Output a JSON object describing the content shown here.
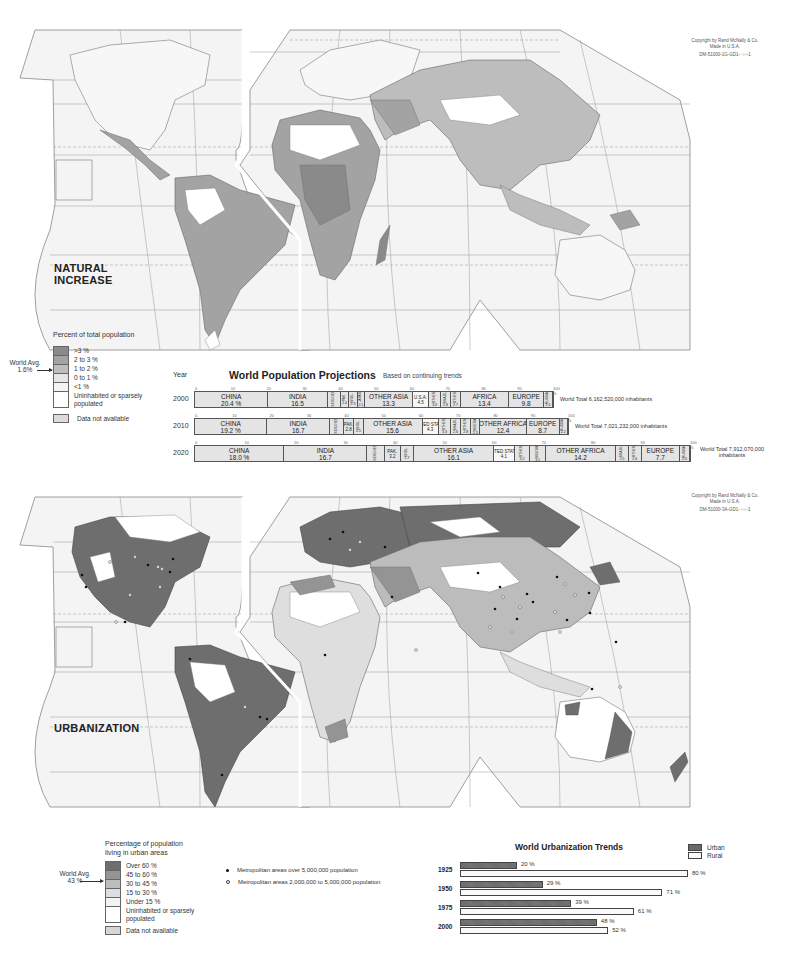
{
  "natural_increase_map": {
    "title_line1": "NATURAL",
    "title_line2": "INCREASE",
    "copyright_line1": "Copyright by Rand McNally & Co.",
    "copyright_line2": "Made in U.S.A.",
    "copyright_line3": "DM-51000-1G-GD1- -:-:-1",
    "grid_labels": {
      "arctic_circle": "Arctic Circle",
      "tropic_cancer": "Tropic of Cancer",
      "tropic_capricorn_1": "Tropic of",
      "tropic_capricorn_2": "Capricorn",
      "equator_west": "Equator",
      "equator_east": "Equator",
      "lon_100w": "100 W",
      "lon_140": "140",
      "lon_160": "160",
      "lat_0": "0",
      "lat_20": "20",
      "lat_40": "40",
      "lat_60": "60"
    },
    "legend": {
      "title": "Percent of total population",
      "world_avg_line1": "World Avg.",
      "world_avg_line2": "1.6%",
      "items": [
        {
          "label": ">3 %",
          "color": "#8a8a8a"
        },
        {
          "label": "2 to 3 %",
          "color": "#a3a3a3"
        },
        {
          "label": "1 to 2 %",
          "color": "#bdbdbd"
        },
        {
          "label": "0 to 1 %",
          "color": "#e6e6e6"
        },
        {
          "label": "<1 %",
          "color": "#f4f4f4"
        },
        {
          "label": "Uninhabited or sparsely populated",
          "color": "#ffffff"
        }
      ],
      "na_label": "Data not available",
      "na_color": "#dcdcdc"
    }
  },
  "population_projections": {
    "year_header": "Year",
    "title": "World Population Projections",
    "subtitle": "Based on continuing trends",
    "rows": [
      {
        "year": "2000",
        "total": "World Total 6,162,520,000 inhabitants",
        "segments": [
          {
            "name": "CHINA",
            "value": "20.4 %",
            "pct": 20.4,
            "size": "large"
          },
          {
            "name": "INDIA",
            "value": "16.5",
            "pct": 16.5,
            "size": "large"
          },
          {
            "name": "INDO-NESIA",
            "value": "3.6",
            "pct": 3.6,
            "size": "small"
          },
          {
            "name": "PAK.",
            "value": "2.4",
            "pct": 2.4,
            "size": "small"
          },
          {
            "name": "BNGL.",
            "value": "2.3",
            "pct": 2.3,
            "size": "small"
          },
          {
            "name": "JAPAN",
            "value": "2.1",
            "pct": 2.1,
            "size": "small"
          },
          {
            "name": "OTHER ASIA",
            "value": "13.3",
            "pct": 13.3,
            "size": "large"
          },
          {
            "name": "U.S.A.",
            "value": "4.5",
            "pct": 4.5,
            "size": "mid",
            "white": true
          },
          {
            "name": "OTHER",
            "value": "3.3",
            "pct": 3.3,
            "size": "small"
          },
          {
            "name": "BRAZIL",
            "value": "2.8",
            "pct": 2.8,
            "size": "small"
          },
          {
            "name": "OTHER",
            "value": "2.7",
            "pct": 2.7,
            "size": "small"
          },
          {
            "name": "AFRICA",
            "value": "13.4",
            "pct": 13.4,
            "size": "large"
          },
          {
            "name": "EUROPE",
            "value": "9.8",
            "pct": 9.8,
            "size": "large"
          },
          {
            "name": "RUSSIA",
            "value": "2.4",
            "pct": 2.4,
            "size": "small"
          }
        ]
      },
      {
        "year": "2010",
        "total": "World Total 7,021,232,000 inhabitants",
        "segments": [
          {
            "name": "CHINA",
            "value": "19.2 %",
            "pct": 19.2,
            "size": "large"
          },
          {
            "name": "INDIA",
            "value": "16.7",
            "pct": 16.7,
            "size": "large"
          },
          {
            "name": "INDO-NESIA",
            "value": "3.6",
            "pct": 3.6,
            "size": "small"
          },
          {
            "name": "PAK.",
            "value": "2.8",
            "pct": 2.8,
            "size": "mid"
          },
          {
            "name": "BNGL.",
            "value": "2.5",
            "pct": 2.5,
            "size": "small"
          },
          {
            "name": "OTHER ASIA",
            "value": "15.6",
            "pct": 15.6,
            "size": "large"
          },
          {
            "name": "UNITED STATES",
            "value": "4.3",
            "pct": 4.3,
            "size": "mid",
            "white": true
          },
          {
            "name": "OTHER",
            "value": "3.3",
            "pct": 3.3,
            "size": "small"
          },
          {
            "name": "BRAZIL",
            "value": "2.6",
            "pct": 2.6,
            "size": "small"
          },
          {
            "name": "OTHER",
            "value": "2.8",
            "pct": 2.8,
            "size": "small"
          },
          {
            "name": "NIGERIA",
            "value": "2.3",
            "pct": 2.3,
            "size": "small"
          },
          {
            "name": "OTHER AFRICA",
            "value": "12.4",
            "pct": 12.4,
            "size": "large"
          },
          {
            "name": "EUROPE",
            "value": "8.7",
            "pct": 8.7,
            "size": "large"
          },
          {
            "name": "RUSSIA",
            "value": "2.2",
            "pct": 2.2,
            "size": "small"
          }
        ]
      },
      {
        "year": "2020",
        "total": "World Total 7,912,070,000 inhabitants",
        "segments": [
          {
            "name": "CHINA",
            "value": "18.0 %",
            "pct": 18.0,
            "size": "large"
          },
          {
            "name": "INDIA",
            "value": "16.7",
            "pct": 16.7,
            "size": "large"
          },
          {
            "name": "INDO-NESIA",
            "value": "3.5",
            "pct": 3.5,
            "size": "small"
          },
          {
            "name": "PAK.",
            "value": "3.2",
            "pct": 3.2,
            "size": "mid"
          },
          {
            "name": "BNGL.",
            "value": "2.7",
            "pct": 2.7,
            "size": "small"
          },
          {
            "name": "OTHER ASIA",
            "value": "16.1",
            "pct": 16.1,
            "size": "large"
          },
          {
            "name": "UNITED STATES",
            "value": "4.1",
            "pct": 4.1,
            "size": "mid",
            "white": true
          },
          {
            "name": "OTHER",
            "value": "3.2",
            "pct": 3.2,
            "size": "small"
          },
          {
            "name": "NIGERIA",
            "value": "3.1",
            "pct": 3.1,
            "size": "small"
          },
          {
            "name": "OTHER AFRICA",
            "value": "14.2",
            "pct": 14.2,
            "size": "large"
          },
          {
            "name": "BRAZIL",
            "value": "2.5",
            "pct": 2.5,
            "size": "small"
          },
          {
            "name": "OTHER",
            "value": "2.6",
            "pct": 2.6,
            "size": "small"
          },
          {
            "name": "EUROPE",
            "value": "7.7",
            "pct": 7.7,
            "size": "large"
          },
          {
            "name": "RUSSIA",
            "value": "2.0",
            "pct": 2.0,
            "size": "small"
          }
        ]
      }
    ],
    "axis_ticks": [
      "0",
      "10",
      "20",
      "30",
      "40",
      "50",
      "60",
      "70",
      "80",
      "90",
      "100 %"
    ]
  },
  "urbanization_map": {
    "title": "URBANIZATION",
    "copyright_line1": "Copyright by Rand McNally & Co.",
    "copyright_line2": "Made in U.S.A.",
    "copyright_line3": "DM-51000-3A-GD1- -:-:-1",
    "grid_labels": {
      "arctic_circle": "Arctic Circle",
      "tropic_cancer": "Tropic of Cancer",
      "tropic_capricorn_1": "Tropic of",
      "tropic_capricorn_2": "Capricorn",
      "equator_west": "Equator",
      "equator_east": "Equator",
      "lon_100w": "100 W",
      "lon_140": "140",
      "lon_160": "160"
    },
    "legend": {
      "title_line1": "Percentage of population",
      "title_line2": "living in urban areas",
      "world_avg_line1": "World Avg.",
      "world_avg_line2": "43 %",
      "items": [
        {
          "label": "Over 60 %",
          "color": "#6e6e6e"
        },
        {
          "label": "45 to 60 %",
          "color": "#949494"
        },
        {
          "label": "30 to 45 %",
          "color": "#bcbcbc"
        },
        {
          "label": "15 to 30 %",
          "color": "#dedede"
        },
        {
          "label": "Under 15 %",
          "color": "#f3f3f3"
        },
        {
          "label": "Uninhabited or sparsely populated",
          "color": "#ffffff"
        }
      ],
      "na_label": "Data not available",
      "na_color": "#d6d6d6",
      "metro_large": "Metropolitan areas over 5,000,000 population",
      "metro_medium": "Metropolitan areas 2,000,000 to 5,000,000 population"
    }
  },
  "urbanization_trends": {
    "title": "World Urbanization Trends",
    "legend_urban": "Urban",
    "legend_rural": "Rural",
    "rows": [
      {
        "year": "1925",
        "urban": "20 %",
        "rural": "80 %",
        "urban_pct": 20,
        "rural_pct": 80
      },
      {
        "year": "1950",
        "urban": "29 %",
        "rural": "71 %",
        "urban_pct": 29,
        "rural_pct": 71
      },
      {
        "year": "1975",
        "urban": "39 %",
        "rural": "61 %",
        "urban_pct": 39,
        "rural_pct": 61
      },
      {
        "year": "2000",
        "urban": "48 %",
        "rural": "52 %",
        "urban_pct": 48,
        "rural_pct": 52
      }
    ]
  },
  "chart_data": [
    {
      "type": "bar",
      "title": "World Population Projections",
      "subtitle": "Based on continuing trends",
      "orientation": "horizontal-stacked",
      "categories": [
        "2000",
        "2010",
        "2020"
      ],
      "xlabel": "Percent of world population",
      "xlim": [
        0,
        100
      ],
      "series_by_year": {
        "2000": {
          "China": 20.4,
          "India": 16.5,
          "Indonesia": 3.6,
          "Pakistan": 2.4,
          "Bangladesh": 2.3,
          "Japan": 2.1,
          "Other Asia": 13.3,
          "U.S.A.": 4.5,
          "Other (N. America)": 3.3,
          "Brazil": 2.8,
          "Other (S. America)": 2.7,
          "Africa": 13.4,
          "Europe": 9.8,
          "Russia": 2.4
        },
        "2010": {
          "China": 19.2,
          "India": 16.7,
          "Indonesia": 3.6,
          "Pakistan": 2.8,
          "Bangladesh": 2.5,
          "Other Asia": 15.6,
          "United States": 4.3,
          "Other (N. America)": 3.3,
          "Brazil": 2.6,
          "Other (S. America)": 2.8,
          "Nigeria": 2.3,
          "Other Africa": 12.4,
          "Europe": 8.7,
          "Russia": 2.2
        },
        "2020": {
          "China": 18.0,
          "India": 16.7,
          "Indonesia": 3.5,
          "Pakistan": 3.2,
          "Bangladesh": 2.7,
          "Other Asia": 16.1,
          "United States": 4.1,
          "Other (N. America)": 3.2,
          "Nigeria": 3.1,
          "Other Africa": 14.2,
          "Brazil": 2.5,
          "Other (S. America)": 2.6,
          "Europe": 7.7,
          "Russia": 2.0
        }
      },
      "totals": {
        "2000": "6,162,520,000",
        "2010": "7,021,232,000",
        "2020": "7,912,070,000"
      }
    },
    {
      "type": "bar",
      "title": "World Urbanization Trends",
      "orientation": "horizontal",
      "categories": [
        "1925",
        "1950",
        "1975",
        "2000"
      ],
      "series": [
        {
          "name": "Urban",
          "values": [
            20,
            29,
            39,
            48
          ]
        },
        {
          "name": "Rural",
          "values": [
            80,
            71,
            61,
            52
          ]
        }
      ],
      "xlim": [
        0,
        100
      ],
      "legend_position": "top-right"
    }
  ]
}
